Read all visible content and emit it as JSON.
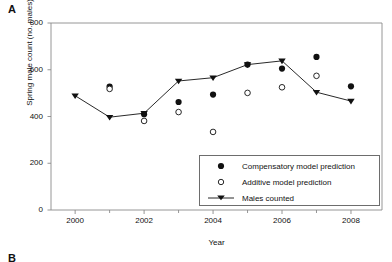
{
  "figure": {
    "panel_a_label": "A",
    "panel_b_label": "B"
  },
  "chart_data": {
    "type": "scatter",
    "title": "",
    "xlabel": "Year",
    "ylabel": "Spring male count (no. males)",
    "xlim": [
      1999.3,
      2008.9
    ],
    "ylim": [
      0,
      800
    ],
    "xticks": [
      2000,
      2001,
      2002,
      2003,
      2004,
      2005,
      2006,
      2007,
      2008
    ],
    "xtick_labels": [
      "2000",
      "",
      "2002",
      "",
      "2004",
      "",
      "2006",
      "",
      "2008"
    ],
    "yticks": [
      0,
      200,
      400,
      600,
      800
    ],
    "ytick_labels": [
      "0",
      "200",
      "400",
      "600",
      "800"
    ],
    "grid": false,
    "legend_position": "lower right",
    "series": [
      {
        "name": "Compensatory model prediction",
        "marker": "filled-circle",
        "line": false,
        "color": "#111111",
        "x": [
          2001,
          2002,
          2003,
          2004,
          2005,
          2006,
          2007,
          2008
        ],
        "values": [
          528,
          410,
          462,
          494,
          622,
          605,
          655,
          529
        ]
      },
      {
        "name": "Additive model prediction",
        "marker": "open-circle",
        "line": false,
        "color": "#111111",
        "x": [
          2001,
          2002,
          2003,
          2004,
          2005,
          2006,
          2007
        ],
        "values": [
          518,
          381,
          419,
          334,
          501,
          525,
          574
        ]
      },
      {
        "name": "Males counted",
        "marker": "filled-triangle-down",
        "line": true,
        "color": "#111111",
        "x": [
          2000,
          2001,
          2002,
          2003,
          2004,
          2005,
          2006,
          2007,
          2008
        ],
        "values": [
          489,
          397,
          414,
          552,
          566,
          622,
          638,
          504,
          466
        ]
      }
    ]
  }
}
